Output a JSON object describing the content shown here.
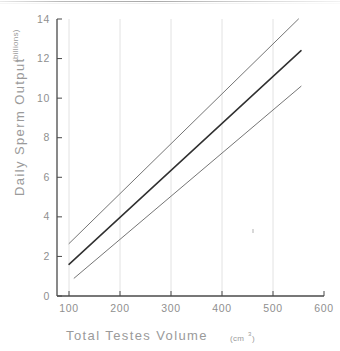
{
  "chart_data": {
    "type": "line",
    "title": "",
    "xlabel": "Total Testes Volume",
    "xlabel_unit": "(cm",
    "xlabel_unit_sup": "3",
    "xlabel_unit_close": ")",
    "ylabel": "Daily Sperm Output",
    "ylabel_unit": "(billions)",
    "xlim": [
      100,
      600
    ],
    "ylim": [
      0,
      14
    ],
    "xticks": [
      100,
      200,
      300,
      400,
      500,
      600
    ],
    "xtick_labels": [
      "100",
      "200",
      "300",
      "400",
      "500",
      "600"
    ],
    "yticks": [
      0,
      2,
      4,
      6,
      8,
      10,
      12,
      14
    ],
    "ytick_labels": [
      "0",
      "2",
      "4",
      "6",
      "8",
      "10",
      "12",
      "14"
    ],
    "grid": "vertical-only",
    "legend": "none",
    "series": [
      {
        "name": "upper confidence limit",
        "color": "#757575",
        "width": 1.0,
        "x": [
          100,
          550
        ],
        "values": [
          2.65,
          14.0
        ]
      },
      {
        "name": "regression line",
        "color": "#303030",
        "width": 1.5,
        "x": [
          100,
          555
        ],
        "values": [
          1.6,
          12.4
        ]
      },
      {
        "name": "lower confidence limit",
        "color": "#757575",
        "width": 1.0,
        "x": [
          110,
          555
        ],
        "values": [
          0.9,
          10.6
        ]
      }
    ],
    "axis_color": "#4a4a4a",
    "grid_color": "#e2e2e2",
    "tick_color": "#8f8f8f",
    "background": "#ffffff"
  }
}
